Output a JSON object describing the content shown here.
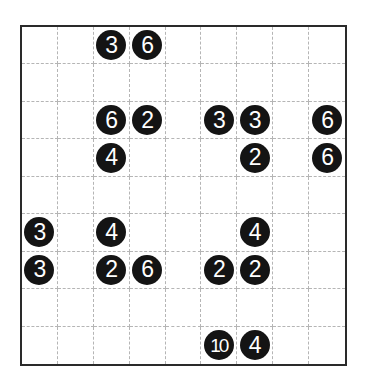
{
  "puzzle": {
    "rows": 9,
    "cols": 9,
    "colors": {
      "clue_fill": "#141414",
      "clue_text": "#ffffff",
      "border": "#2a2a2a",
      "grid_line": "#b5b5b5"
    },
    "clues": [
      {
        "row": 0,
        "col": 2,
        "value": "3"
      },
      {
        "row": 0,
        "col": 3,
        "value": "6"
      },
      {
        "row": 2,
        "col": 2,
        "value": "6"
      },
      {
        "row": 2,
        "col": 3,
        "value": "2"
      },
      {
        "row": 2,
        "col": 5,
        "value": "3"
      },
      {
        "row": 2,
        "col": 6,
        "value": "3"
      },
      {
        "row": 2,
        "col": 8,
        "value": "6"
      },
      {
        "row": 3,
        "col": 2,
        "value": "4"
      },
      {
        "row": 3,
        "col": 6,
        "value": "2"
      },
      {
        "row": 3,
        "col": 8,
        "value": "6"
      },
      {
        "row": 5,
        "col": 0,
        "value": "3"
      },
      {
        "row": 5,
        "col": 2,
        "value": "4"
      },
      {
        "row": 5,
        "col": 6,
        "value": "4"
      },
      {
        "row": 6,
        "col": 0,
        "value": "3"
      },
      {
        "row": 6,
        "col": 2,
        "value": "2"
      },
      {
        "row": 6,
        "col": 3,
        "value": "6"
      },
      {
        "row": 6,
        "col": 5,
        "value": "2"
      },
      {
        "row": 6,
        "col": 6,
        "value": "2"
      },
      {
        "row": 8,
        "col": 5,
        "value": "10"
      },
      {
        "row": 8,
        "col": 6,
        "value": "4"
      }
    ]
  }
}
